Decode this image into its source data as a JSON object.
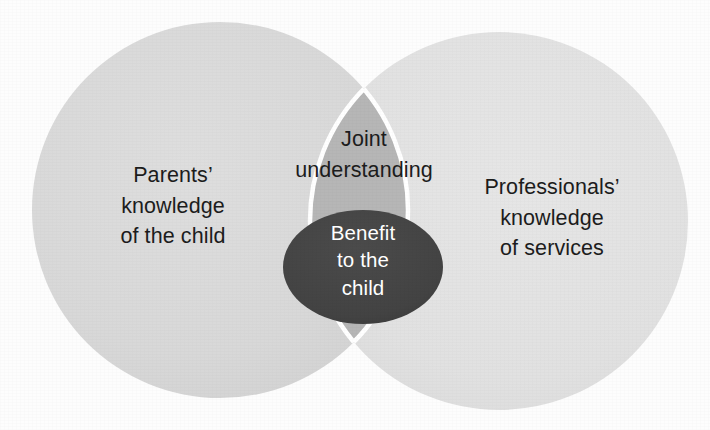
{
  "diagram": {
    "type": "venn",
    "title": "",
    "background_color": "#fdfdfd",
    "sets": [
      {
        "id": "parents",
        "label": "Parents’\nknowledge\nof the child",
        "fill_color": "#d8d8d8",
        "text_color": "#1c1c1c",
        "center": [
          220,
          210
        ],
        "radius": 188
      },
      {
        "id": "professionals",
        "label": "Professionals’\nknowledge\nof services",
        "fill_color": "#e2e2e2",
        "text_color": "#1c1c1c",
        "center": [
          499,
          221
        ],
        "radius": 189
      }
    ],
    "intersection": {
      "id": "joint-understanding",
      "label": "Joint\nunderstanding",
      "fill_color": "#b6b6b6",
      "text_color": "#1c1c1c",
      "outline_color": "#ffffff"
    },
    "core": {
      "id": "benefit-to-the-child",
      "label": "Benefit\nto the\nchild",
      "fill_color": "#434343",
      "text_color": "#ffffff",
      "center": [
        363,
        267
      ],
      "radius_x": 80,
      "radius_y": 57
    }
  }
}
